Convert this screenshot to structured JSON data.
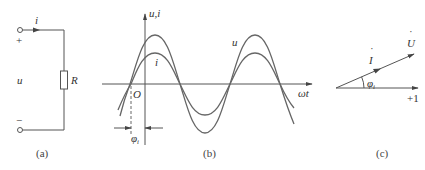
{
  "panels": {
    "a": {
      "caption": "(a)",
      "labels": {
        "current": "i",
        "plus": "+",
        "minus": "−",
        "voltage": "u",
        "resistor": "R"
      }
    },
    "b": {
      "caption": "(b)",
      "labels": {
        "y_axis": "u,i",
        "x_axis": "ωt",
        "origin": "O",
        "u_curve": "u",
        "i_curve": "i",
        "phase": "φ",
        "phase_sub": "i"
      }
    },
    "c": {
      "caption": "(c)",
      "labels": {
        "voltage_phasor": "U",
        "current_phasor": "I",
        "real_axis": "+1",
        "phase": "φ",
        "phase_sub": "i"
      }
    }
  },
  "colors": {
    "stroke": "#555555",
    "wave": "#666666",
    "text": "#333333"
  }
}
